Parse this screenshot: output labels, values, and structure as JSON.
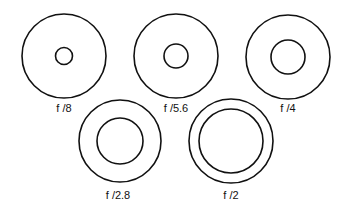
{
  "figure": {
    "title": "",
    "stroke_color": "#111111",
    "background": "#ffffff",
    "apertures": [
      {
        "label": "f /8",
        "cx": 64,
        "cy": 56,
        "outer_r": 42,
        "inner_r": 8.5,
        "label_x": 64,
        "label_y": 102
      },
      {
        "label": "f /5.6",
        "cx": 176,
        "cy": 56,
        "outer_r": 42,
        "inner_r": 12,
        "label_x": 176,
        "label_y": 102
      },
      {
        "label": "f /4",
        "cx": 288,
        "cy": 57,
        "outer_r": 42,
        "inner_r": 17,
        "label_x": 288,
        "label_y": 102
      },
      {
        "label": "f /2.8",
        "cx": 120,
        "cy": 141,
        "outer_r": 41,
        "inner_r": 23,
        "label_x": 118,
        "label_y": 189
      },
      {
        "label": "f /2",
        "cx": 231,
        "cy": 141,
        "outer_r": 42,
        "inner_r": 32,
        "label_x": 231,
        "label_y": 189
      }
    ]
  }
}
